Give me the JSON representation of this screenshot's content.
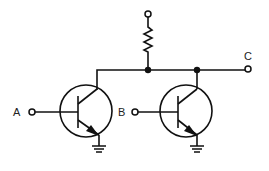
{
  "diagram": {
    "type": "circuit-schematic",
    "labels": {
      "input_a": "A",
      "input_b": "B",
      "output_c": "C"
    },
    "components": [
      {
        "id": "R1",
        "kind": "resistor",
        "role": "pull-up"
      },
      {
        "id": "Q1",
        "kind": "npn-transistor",
        "input": "A"
      },
      {
        "id": "Q2",
        "kind": "npn-transistor",
        "input": "B"
      },
      {
        "id": "GND1",
        "kind": "ground"
      },
      {
        "id": "GND2",
        "kind": "ground"
      }
    ],
    "colors": {
      "stroke": "#111111",
      "background": "#ffffff"
    }
  }
}
